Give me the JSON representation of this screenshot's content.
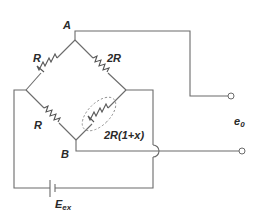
{
  "diagram": {
    "type": "wheatstone-bridge",
    "nodes": {
      "top": "A",
      "bottom": "B"
    },
    "resistors": {
      "top_left": "R",
      "top_right": "2R",
      "bottom_left": "R",
      "bottom_right_prefix": "2R",
      "bottom_right_suffix": "(1+x)"
    },
    "output_label_base": "e",
    "output_label_sub": "0",
    "source_label_base": "E",
    "source_label_sub": "ex",
    "highlight": "dashed-ellipse-around-bottom-right-resistor",
    "colors": {
      "wire": "#6b6b6b",
      "text": "#2a2a2a",
      "background": "#ffffff"
    }
  }
}
